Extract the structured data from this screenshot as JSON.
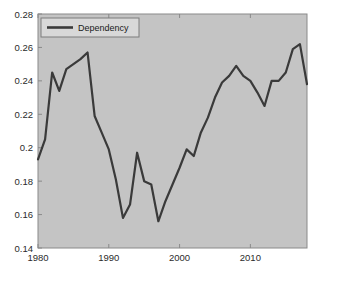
{
  "figure": {
    "background_color": "#ffffff",
    "plot_background_color": "#c4c4c4",
    "axis_color": "#8a8a8a",
    "line_color": "#3a3a3a"
  },
  "legend": {
    "entries": [
      {
        "label": "Dependency",
        "color": "#3a3a3a"
      }
    ],
    "position": "top-left",
    "box_background": "#d8d8d8",
    "box_border": "#7d7d7d"
  },
  "axes": {
    "y_tick_labels": [
      "0.14",
      "0.16",
      "0.18",
      "0.2",
      "0.22",
      "0.24",
      "0.26",
      "0.28"
    ],
    "x_tick_labels": [
      "1980",
      "1990",
      "2000",
      "2010"
    ]
  },
  "chart_data": {
    "type": "line",
    "title": "",
    "xlabel": "",
    "ylabel": "",
    "xlim": [
      1980,
      2018
    ],
    "ylim": [
      0.14,
      0.28
    ],
    "xticks": [
      1980,
      1990,
      2000,
      2010
    ],
    "yticks": [
      0.14,
      0.16,
      0.18,
      0.2,
      0.22,
      0.24,
      0.26,
      0.28
    ],
    "grid": false,
    "legend_position": "upper left",
    "series": [
      {
        "name": "Dependency",
        "color": "#3a3a3a",
        "x": [
          1980,
          1981,
          1982,
          1983,
          1984,
          1985,
          1986,
          1987,
          1988,
          1989,
          1990,
          1991,
          1992,
          1993,
          1994,
          1995,
          1996,
          1997,
          1998,
          1999,
          2000,
          2001,
          2002,
          2003,
          2004,
          2005,
          2006,
          2007,
          2008,
          2009,
          2010,
          2011,
          2012,
          2013,
          2014,
          2015,
          2016,
          2017,
          2018
        ],
        "values": [
          0.193,
          0.205,
          0.245,
          0.234,
          0.247,
          0.25,
          0.253,
          0.257,
          0.219,
          0.209,
          0.199,
          0.181,
          0.158,
          0.166,
          0.197,
          0.18,
          0.178,
          0.156,
          0.168,
          0.178,
          0.188,
          0.199,
          0.195,
          0.209,
          0.218,
          0.23,
          0.239,
          0.243,
          0.249,
          0.243,
          0.24,
          0.233,
          0.225,
          0.24,
          0.24,
          0.245,
          0.259,
          0.262,
          0.238
        ]
      }
    ]
  }
}
